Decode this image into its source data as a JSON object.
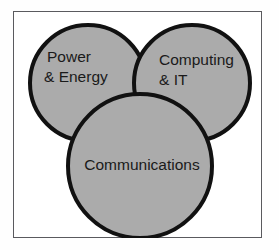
{
  "figure": {
    "title": "",
    "frame_border_color": "#5a5a5e",
    "background_color": "#ffffff"
  },
  "chart_data": {
    "type": "venn",
    "title": "",
    "xlabel": "",
    "ylabel": "",
    "legend_position": "none",
    "grid": false,
    "fill_color": "#ababab",
    "stroke_color": "#111111",
    "text_color": "#1a1a1a",
    "sets": [
      {
        "id": "power-energy",
        "label": "Power & Energy",
        "label_lines": [
          "Power",
          "& Energy"
        ],
        "cx": 75,
        "cy": 72,
        "r": 58
      },
      {
        "id": "computing-it",
        "label": "Computing & IT",
        "label_lines": [
          "Computing",
          "& IT"
        ],
        "cx": 179,
        "cy": 72,
        "r": 58
      },
      {
        "id": "communications",
        "label": "Communications",
        "label_lines": [
          "Communications"
        ],
        "cx": 127,
        "cy": 155,
        "r": 72
      }
    ]
  },
  "labels": {
    "power_energy_line1": "Power",
    "power_energy_line2": "& Energy",
    "computing_it_line1": "Computing",
    "computing_it_line2": "& IT",
    "communications_line1": "Communications"
  }
}
